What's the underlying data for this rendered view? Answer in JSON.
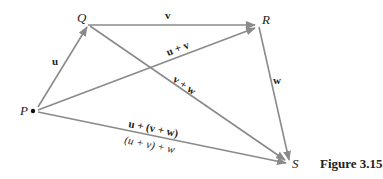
{
  "figure": {
    "caption": "Figure 3.15",
    "points": {
      "P": {
        "label": "P",
        "x": 36,
        "y": 110
      },
      "Q": {
        "label": "Q",
        "x": 88,
        "y": 25
      },
      "R": {
        "label": "R",
        "x": 258,
        "y": 25
      },
      "S": {
        "label": "S",
        "x": 290,
        "y": 163
      }
    },
    "vectors": [
      {
        "id": "u",
        "from": "P",
        "to": "Q",
        "label": "u"
      },
      {
        "id": "v",
        "from": "Q",
        "to": "R",
        "label": "v"
      },
      {
        "id": "w",
        "from": "R",
        "to": "S",
        "label": "w"
      },
      {
        "id": "u_plus_v",
        "from": "P",
        "to": "R",
        "label": "u + v"
      },
      {
        "id": "v_plus_w",
        "from": "Q",
        "to": "S",
        "label": "v + w"
      },
      {
        "id": "sum",
        "from": "P",
        "to": "S",
        "label_top": "u + (v + w)",
        "label_bottom": "(u + v) + w"
      }
    ],
    "colors": {
      "line": "#8a8a8a",
      "text": "#222222",
      "dot": "#111111"
    }
  }
}
